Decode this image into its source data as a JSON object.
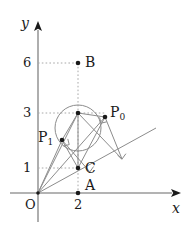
{
  "figure": {
    "kind": "geometry-diagram",
    "width": 196,
    "height": 228,
    "stroke_color": "#8c8c8c",
    "axis_color": "#9a9a9a",
    "point_color": "#1a1a1a",
    "dotted_color": "#a8a8a8",
    "background": "#ffffff"
  },
  "axes": {
    "x_label": "x",
    "y_label": "y",
    "origin_label": "O",
    "x_ticks": [
      {
        "label": "2",
        "value": 2
      }
    ],
    "y_ticks": [
      {
        "label": "1",
        "value": 1
      },
      {
        "label": "3",
        "value": 3
      },
      {
        "label": "6",
        "value": 6
      }
    ],
    "x_range": [
      -0.2,
      7.1
    ],
    "y_range": [
      -0.4,
      6.6
    ]
  },
  "points": [
    {
      "name": "B",
      "label": "B",
      "sub": "",
      "x": 2.0,
      "y": 6.0
    },
    {
      "name": "P0",
      "label": "P",
      "sub": "0",
      "x": 3.35,
      "y": 3.4
    },
    {
      "name": "P1",
      "label": "P",
      "sub": "1",
      "x": 1.2,
      "y": 2.48
    },
    {
      "name": "C",
      "label": "C",
      "sub": "",
      "x": 2.0,
      "y": 1.0
    },
    {
      "name": "A",
      "label": "A",
      "sub": "",
      "x": 2.0,
      "y": 0.0
    },
    {
      "name": "M",
      "label": "",
      "sub": "",
      "x": 2.0,
      "y": 3.0
    }
  ],
  "circle": {
    "center_x": 2.0,
    "center_y": 2.45,
    "radius": 1.15
  },
  "ray": {
    "label": "",
    "from_x": 0.0,
    "from_y": 0.0,
    "to_x": 5.85,
    "to_y": 2.45
  },
  "right_angles": [
    {
      "at_x": 3.35,
      "at_y": 3.4
    },
    {
      "at_x": 1.2,
      "at_y": 2.48
    },
    {
      "at_x": 2.62,
      "at_y": 1.1
    },
    {
      "at_x": 4.1,
      "at_y": 1.72
    }
  ],
  "labels": {
    "B": "B",
    "C": "C",
    "A": "A",
    "O": "O",
    "x": "x",
    "y": "y",
    "tick_1": "1",
    "tick_3": "3",
    "tick_6": "6",
    "P0_base": "P",
    "P0_sub": "0",
    "P1_base": "P",
    "P1_sub": "1"
  }
}
